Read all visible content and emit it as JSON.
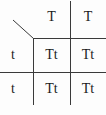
{
  "diagram": {
    "type": "punnett-square",
    "col_headers": [
      "T",
      "T"
    ],
    "row_headers": [
      "t",
      "t"
    ],
    "cells": [
      [
        "Tt",
        "Tt"
      ],
      [
        "Tt",
        "Tt"
      ]
    ],
    "colors": {
      "background": "#fdfdfd",
      "line": "#3a3a3a",
      "text": "#1a1a1a"
    }
  }
}
